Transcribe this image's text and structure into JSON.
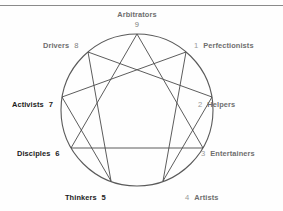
{
  "diagram": {
    "type": "enneagram",
    "circle": {
      "cx": 137,
      "cy": 110,
      "r": 76,
      "stroke": "#5a5a5a"
    },
    "line_color": "#4a4a4a",
    "rule_color": "#8a8a8a",
    "points": [
      {
        "number": "9",
        "label": "Arbitrators",
        "angle_deg": 90,
        "position": "top",
        "style": "top-style",
        "x": 137,
        "y": 34
      },
      {
        "number": "1",
        "label": "Perfectionists",
        "angle_deg": 50,
        "position": "upper-right",
        "style": "right-style",
        "x": 186,
        "y": 52
      },
      {
        "number": "2",
        "label": "Helpers",
        "angle_deg": 10,
        "position": "right",
        "style": "right-style",
        "x": 212,
        "y": 97
      },
      {
        "number": "3",
        "label": "Entertainers",
        "angle_deg": -30,
        "position": "lower-right",
        "style": "right-style",
        "x": 203,
        "y": 148
      },
      {
        "number": "4",
        "label": "Artists",
        "angle_deg": -70,
        "position": "bottom-right",
        "style": "right-style",
        "x": 163,
        "y": 181
      },
      {
        "number": "5",
        "label": "Thinkers",
        "angle_deg": -110,
        "position": "bottom-left",
        "style": "left-style",
        "x": 111,
        "y": 181
      },
      {
        "number": "6",
        "label": "Disciples",
        "angle_deg": -150,
        "position": "lower-left",
        "style": "left-style",
        "x": 71,
        "y": 148
      },
      {
        "number": "7",
        "label": "Activists",
        "angle_deg": 170,
        "position": "left",
        "style": "left-style",
        "x": 62,
        "y": 97
      },
      {
        "number": "8",
        "label": "Drivers",
        "angle_deg": 130,
        "position": "upper-left",
        "style": "left-style",
        "x": 88,
        "y": 52
      }
    ],
    "triangle_path": [
      "9",
      "3",
      "6",
      "9"
    ],
    "hexad_path": [
      "1",
      "4",
      "2",
      "8",
      "5",
      "7",
      "1"
    ]
  }
}
